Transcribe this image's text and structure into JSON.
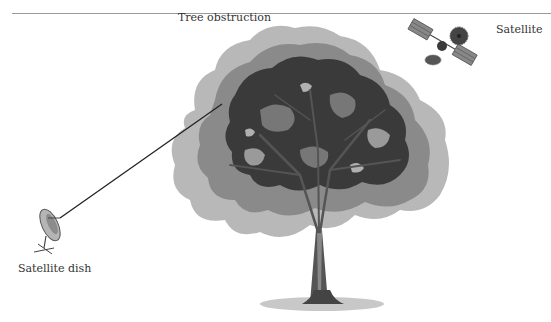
{
  "diagram": {
    "labels": {
      "tree": "Tree obstruction",
      "satellite": "Satellite",
      "dish": "Satellite dish"
    },
    "colors": {
      "foliage_dark": "#3a3a3a",
      "foliage_mid": "#777777",
      "foliage_light": "#b8b8b8",
      "trunk": "#555555",
      "ground_shadow": "#c8c8c8",
      "signal_line": "#222222",
      "rule": "#9a9a9a"
    }
  }
}
